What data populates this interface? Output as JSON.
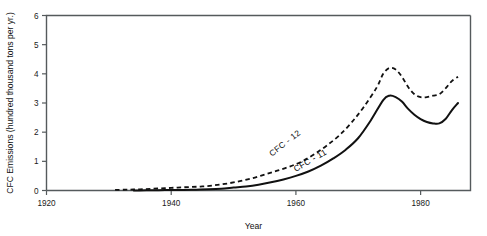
{
  "chart_data": {
    "type": "line",
    "title": "",
    "xlabel": "Year",
    "ylabel": "CFC  Emissions (hundred thousand tons per yr.)",
    "xlim": [
      1920,
      1988
    ],
    "ylim": [
      0,
      6
    ],
    "xticks": [
      1920,
      1940,
      1960,
      1980
    ],
    "xticklabels": [
      "1920",
      "1940",
      "1960",
      "1980"
    ],
    "yticks": [
      0,
      1,
      2,
      3,
      4,
      5,
      6
    ],
    "yticklabels": [
      "0",
      "1",
      "2",
      "3",
      "4",
      "5",
      "6"
    ],
    "grid": false,
    "legend_position": "inline-labels",
    "series": [
      {
        "name": "CFC - 12",
        "style": "dashed",
        "label_text": "CFC - 12",
        "x": [
          1931,
          1933,
          1935,
          1937,
          1939,
          1941,
          1943,
          1945,
          1947,
          1949,
          1951,
          1953,
          1955,
          1957,
          1959,
          1961,
          1963,
          1965,
          1967,
          1969,
          1971,
          1973,
          1974,
          1975,
          1976,
          1977,
          1978,
          1979,
          1980,
          1981,
          1982,
          1983,
          1984,
          1985,
          1986
        ],
        "values": [
          0.02,
          0.03,
          0.04,
          0.06,
          0.08,
          0.1,
          0.12,
          0.14,
          0.18,
          0.24,
          0.32,
          0.42,
          0.55,
          0.68,
          0.82,
          1.0,
          1.25,
          1.55,
          1.9,
          2.35,
          2.9,
          3.55,
          4.0,
          4.2,
          4.15,
          3.9,
          3.55,
          3.3,
          3.2,
          3.2,
          3.25,
          3.3,
          3.5,
          3.75,
          3.9
        ]
      },
      {
        "name": "CFC - 11",
        "style": "solid",
        "label_text": "CFC - 11",
        "x": [
          1934,
          1936,
          1938,
          1940,
          1942,
          1944,
          1946,
          1948,
          1950,
          1952,
          1954,
          1956,
          1958,
          1960,
          1962,
          1964,
          1966,
          1968,
          1970,
          1972,
          1974,
          1975,
          1976,
          1977,
          1978,
          1979,
          1980,
          1981,
          1982,
          1983,
          1984,
          1985,
          1986
        ],
        "values": [
          0.0,
          0.01,
          0.01,
          0.02,
          0.02,
          0.03,
          0.04,
          0.06,
          0.1,
          0.14,
          0.2,
          0.28,
          0.38,
          0.5,
          0.65,
          0.85,
          1.1,
          1.4,
          1.8,
          2.4,
          3.1,
          3.25,
          3.2,
          3.05,
          2.8,
          2.6,
          2.45,
          2.35,
          2.3,
          2.3,
          2.45,
          2.75,
          3.0
        ]
      }
    ],
    "annotations": [
      {
        "text": "CFC - 12",
        "x": 1958.5,
        "y": 1.55,
        "rotation": -38
      },
      {
        "text": "CFC - 11",
        "x": 1962.5,
        "y": 0.95,
        "rotation": -30
      }
    ]
  }
}
